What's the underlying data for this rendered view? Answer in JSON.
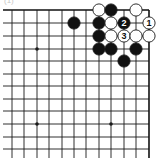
{
  "diagram": {
    "label": "(1)",
    "type": "go-board-corner",
    "grid": {
      "columns_x": [
        12,
        24,
        37,
        49,
        62,
        74,
        86,
        99,
        111,
        124,
        136,
        149
      ],
      "rows_y": [
        10,
        23,
        36,
        49,
        61,
        74,
        86,
        99,
        111,
        124,
        137,
        149
      ],
      "edges": {
        "top": true,
        "right": true,
        "left": false,
        "bottom": false
      },
      "line_color": "#1a1a1a",
      "edge_color": "#111111"
    },
    "star_points": [
      {
        "col": 2,
        "row": 3
      },
      {
        "col": 2,
        "row": 9
      },
      {
        "col": 8,
        "row": 9
      }
    ],
    "stones": [
      {
        "col": 7,
        "row": 0,
        "color": "white"
      },
      {
        "col": 8,
        "row": 0,
        "color": "black"
      },
      {
        "col": 10,
        "row": 0,
        "color": "white"
      },
      {
        "col": 5,
        "row": 1,
        "color": "black"
      },
      {
        "col": 7,
        "row": 1,
        "color": "black"
      },
      {
        "col": 8,
        "row": 1,
        "color": "white"
      },
      {
        "col": 9,
        "row": 1,
        "color": "black",
        "number": "2"
      },
      {
        "col": 11,
        "row": 1,
        "color": "white",
        "number": "1"
      },
      {
        "col": 7,
        "row": 2,
        "color": "black"
      },
      {
        "col": 8,
        "row": 2,
        "color": "white"
      },
      {
        "col": 9,
        "row": 2,
        "color": "white",
        "number": "3"
      },
      {
        "col": 10,
        "row": 2,
        "color": "white"
      },
      {
        "col": 11,
        "row": 2,
        "color": "white"
      },
      {
        "col": 7,
        "row": 3,
        "color": "black"
      },
      {
        "col": 8,
        "row": 3,
        "color": "black"
      },
      {
        "col": 10,
        "row": 3,
        "color": "black"
      },
      {
        "col": 9,
        "row": 4,
        "color": "black"
      }
    ],
    "colors": {
      "black_stone": "#111111",
      "white_stone": "#ffffff",
      "stone_outline": "#1a1a1a"
    }
  }
}
